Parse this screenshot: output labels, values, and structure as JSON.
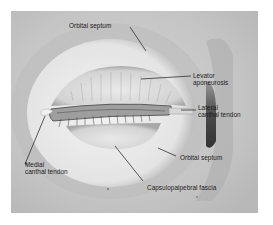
{
  "diagram": {
    "labels": [
      {
        "id": "orbital-septum-upper",
        "text": "Orbital septum"
      },
      {
        "id": "levator-aponeurosis",
        "line1": "Levator",
        "line2": "aponeurosis"
      },
      {
        "id": "lateral-canthal-tendon",
        "line1": "Lateral",
        "line2": "canthal tendon"
      },
      {
        "id": "medial-canthal-tendon",
        "line1": "Medial",
        "line2": "canthal tendon"
      },
      {
        "id": "orbital-septum-lower",
        "text": "Orbital septum"
      },
      {
        "id": "capsulopalpebral-fascia",
        "text": "Capsulopalpebral fascia"
      }
    ],
    "colors": {
      "background": "#ffffff",
      "frame": "#c9c9c9",
      "septum": "#e6e6e6",
      "lid": "#d8d8d8",
      "shadow": "#5a5a5a",
      "text": "#1a1a1a"
    }
  }
}
